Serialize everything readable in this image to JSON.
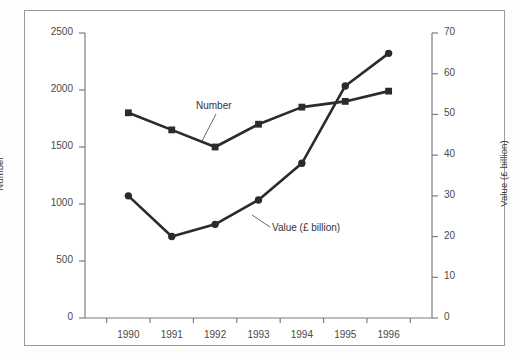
{
  "chart_data": {
    "type": "line",
    "title": "",
    "xlabel": "",
    "categories": [
      "1990",
      "1991",
      "1992",
      "1993",
      "1994",
      "1995",
      "1996"
    ],
    "grid": false,
    "legend_position": "inline-annotations",
    "axes": {
      "left": {
        "label": "Number",
        "ylim": [
          0,
          2500
        ],
        "ticks": [
          0,
          500,
          1000,
          1500,
          2000,
          2500
        ],
        "tick_labels": [
          "0",
          "500",
          "1000",
          "1500",
          "2000",
          "2500"
        ]
      },
      "right": {
        "label": "Value (£ billion)",
        "ylim": [
          0,
          70
        ],
        "ticks": [
          0,
          10,
          20,
          30,
          40,
          50,
          60,
          70
        ],
        "tick_labels": [
          "0",
          "10",
          "20",
          "30",
          "40",
          "50",
          "60",
          "70"
        ]
      }
    },
    "series": [
      {
        "name": "Number",
        "axis": "left",
        "marker": "square",
        "color": "#2b2b2b",
        "annotation": "Number",
        "values": [
          1800,
          1650,
          1500,
          1700,
          1850,
          1900,
          1990
        ]
      },
      {
        "name": "Value (£ billion)",
        "axis": "right",
        "marker": "circle",
        "color": "#2b2b2b",
        "annotation": "Value (£ billion)",
        "values": [
          30,
          20,
          23,
          29,
          38,
          57,
          65
        ]
      }
    ]
  }
}
